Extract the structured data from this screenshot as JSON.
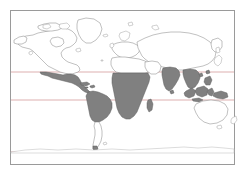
{
  "figure": {
    "kind": "world-map",
    "projection": "equirectangular",
    "title": "",
    "caption": "",
    "background_color": "#ffffff",
    "frame": {
      "color": "#9a9a9a",
      "x": 10,
      "y": 10,
      "width": 225,
      "height": 155,
      "line_width": 1
    }
  },
  "legend": {
    "visible": false,
    "entries": [
      {
        "label": "Distribution range",
        "color": "#808080"
      },
      {
        "label": "Outside range",
        "color": "#ffffff"
      }
    ]
  },
  "graticule": {
    "color": "#d9a6a6",
    "line_width": 0.9,
    "latitude_lines": [
      {
        "name": "tropic-of-cancer",
        "label": "",
        "y_px": 72,
        "degrees": 23.5
      },
      {
        "name": "equator-band-line",
        "label": "",
        "y_px": 100,
        "degrees": -10
      },
      {
        "name": "southern-line",
        "label": "",
        "y_px": 152,
        "degrees": -60
      }
    ],
    "longitude_lines": []
  },
  "shaded_regions": {
    "fill_color": "#808080",
    "outline_color": "#5f5f5f",
    "names": [
      "mexico-central-america",
      "northern-south-america",
      "sub-saharan-africa",
      "india-subcontinent",
      "southeast-asia-indonesia",
      "madagascar"
    ]
  },
  "landmasses": [
    {
      "name": "north-america",
      "shaded": false
    },
    {
      "name": "greenland",
      "shaded": false
    },
    {
      "name": "south-america",
      "shaded": true
    },
    {
      "name": "africa",
      "shaded": true
    },
    {
      "name": "europe",
      "shaded": false
    },
    {
      "name": "asia",
      "shaded": false
    },
    {
      "name": "australia",
      "shaded": false
    },
    {
      "name": "antarctica",
      "shaded": false
    }
  ],
  "axes": {
    "x_ticks": [],
    "y_ticks": [],
    "xlabel": "",
    "ylabel": ""
  },
  "chart_data": {
    "type": "map",
    "title": "",
    "xlabel": "",
    "ylabel": "",
    "categories": [
      "north-america",
      "mexico-central-america",
      "south-america",
      "greenland",
      "europe",
      "north-africa",
      "sub-saharan-africa",
      "madagascar",
      "asia-north",
      "india",
      "southeast-asia-indonesia",
      "australia",
      "antarctica"
    ],
    "values": [
      0,
      1,
      1,
      0,
      0,
      0,
      1,
      1,
      0,
      1,
      1,
      0,
      0
    ],
    "value_meaning": {
      "0": "unshaded (white)",
      "1": "shaded (gray #808080)"
    },
    "legend_position": "none",
    "grid": true
  }
}
